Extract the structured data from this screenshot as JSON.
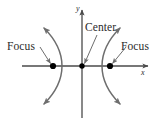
{
  "figure": {
    "type": "hyperbola-diagram",
    "background_color": "#ffffff",
    "curve_color": "#6e6e6e",
    "axis_color": "#4a4a4a",
    "point_color": "#000000",
    "text_color": "#2b2b2b",
    "labels": {
      "focus_left": "Focus",
      "focus_right": "Focus",
      "center": "Center",
      "axis_y": "y",
      "axis_x": "x"
    },
    "points": [
      {
        "name": "focus-left",
        "x": 53,
        "y": 66
      },
      {
        "name": "center",
        "x": 82,
        "y": 66
      },
      {
        "name": "focus-right",
        "x": 110,
        "y": 66
      }
    ],
    "axes": {
      "x_axis": {
        "x1": 22,
        "y1": 66,
        "x2": 150,
        "y2": 66,
        "arrow": "right"
      },
      "y_axis": {
        "x1": 82,
        "y1": 118,
        "x2": 82,
        "y2": 8,
        "arrow": "up"
      }
    },
    "branches": [
      {
        "name": "left-branch",
        "vertex_x": 62,
        "opens": "left",
        "arrowheads": 2
      },
      {
        "name": "right-branch",
        "vertex_x": 102,
        "opens": "right",
        "arrowheads": 2
      }
    ],
    "leaders": [
      {
        "name": "focus-left-leader",
        "from_x": 40,
        "from_y": 47,
        "to_x": 51,
        "to_y": 64
      },
      {
        "name": "focus-right-leader",
        "from_x": 125,
        "from_y": 47,
        "to_x": 112,
        "to_y": 64
      },
      {
        "name": "center-leader",
        "from_x": 96,
        "from_y": 34,
        "to_x": 84,
        "to_y": 64
      }
    ]
  }
}
